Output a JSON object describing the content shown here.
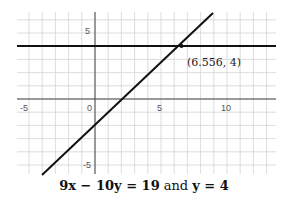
{
  "chart_data": {
    "type": "line",
    "xlabel": "",
    "ylabel": "",
    "xlim": [
      -6,
      13.5
    ],
    "ylim": [
      -6,
      6.5
    ],
    "grid": true,
    "x_ticks": [
      -5,
      0,
      5,
      10
    ],
    "y_ticks": [
      5,
      -5
    ],
    "series": [
      {
        "name": "9x - 10y = 19",
        "equation": "y = (9x - 19)/10",
        "points": [
          [
            -4,
            -5.5
          ],
          [
            8.5,
            5.75
          ]
        ]
      },
      {
        "name": "y = 4",
        "equation": "y = 4",
        "points": [
          [
            -6,
            4
          ],
          [
            13.5,
            4
          ]
        ]
      }
    ],
    "annotations": [
      {
        "text": "(6.556, 4)",
        "x": 6.556,
        "y": 4
      }
    ]
  },
  "labels": {
    "x_neg5": "-5",
    "x_0": "0",
    "x_5": "5",
    "x_10": "10",
    "y_5": "5",
    "y_neg5": "-5",
    "intersection": "(6.556, 4)",
    "caption_eq1": "9x − 10y = 19",
    "caption_and": "and",
    "caption_eq2": "y = 4"
  }
}
